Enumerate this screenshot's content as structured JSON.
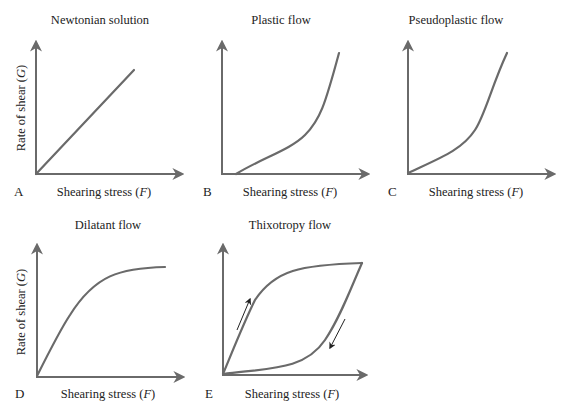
{
  "figure": {
    "panels": [
      {
        "id": "A",
        "letter": "A",
        "title": "Newtonian solution",
        "xlabel_main": "Shearing stress (",
        "xlabel_var": "F",
        "xlabel_end": ")",
        "ylabel_main": "Rate of shear (",
        "ylabel_var": "G",
        "ylabel_end": ")"
      },
      {
        "id": "B",
        "letter": "B",
        "title": "Plastic flow",
        "xlabel_main": "Shearing stress (",
        "xlabel_var": "F",
        "xlabel_end": ")"
      },
      {
        "id": "C",
        "letter": "C",
        "title": "Pseudoplastic flow",
        "xlabel_main": "Shearing stress (",
        "xlabel_var": "F",
        "xlabel_end": ")"
      },
      {
        "id": "D",
        "letter": "D",
        "title": "Dilatant flow",
        "xlabel_main": "Shearing stress (",
        "xlabel_var": "F",
        "xlabel_end": ")",
        "ylabel_main": "Rate of shear (",
        "ylabel_var": "G",
        "ylabel_end": ")"
      },
      {
        "id": "E",
        "letter": "E",
        "title": "Thixotropy flow",
        "xlabel_main": "Shearing stress (",
        "xlabel_var": "F",
        "xlabel_end": ")"
      }
    ],
    "colors": {
      "curve": "#6a6a6a",
      "axis": "#6a6a6a",
      "text": "#222222",
      "annotation_arrow": "#222222"
    }
  }
}
